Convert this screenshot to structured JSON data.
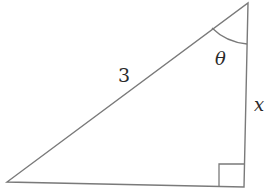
{
  "diagram": {
    "type": "right-triangle",
    "vertices": {
      "top": [
        248,
        3
      ],
      "bottom_right": [
        244,
        187
      ],
      "bottom_left": [
        7,
        182
      ]
    },
    "stroke_color": "#7a7a7a",
    "labels": {
      "hypotenuse": "3",
      "vertical_side": "x",
      "angle": "θ"
    },
    "angle_marker": "arc at top vertex",
    "right_angle_marker": "square at bottom-right vertex"
  }
}
